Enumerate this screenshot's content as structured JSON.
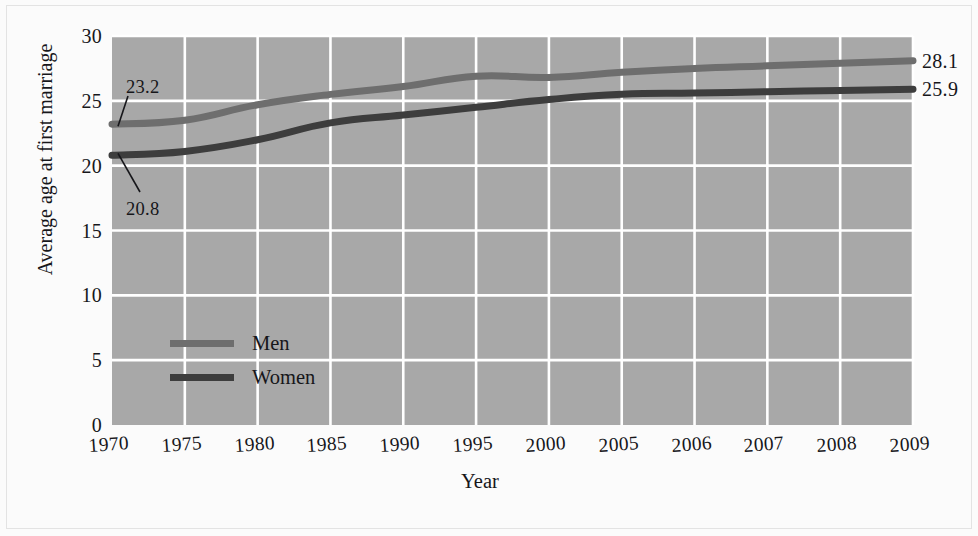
{
  "chart_data": {
    "type": "line",
    "title": "",
    "xlabel": "Year",
    "ylabel": "Average age at first marriage",
    "categories": [
      "1970",
      "1975",
      "1980",
      "1985",
      "1990",
      "1995",
      "2000",
      "2005",
      "2006",
      "2007",
      "2008",
      "2009"
    ],
    "xticklabels": [
      "1970",
      "1975",
      "1980",
      "1985",
      "1990",
      "1995",
      "2000",
      "2005",
      "2006",
      "2007",
      "2008",
      "2009"
    ],
    "yticklabels": [
      "0",
      "5",
      "10",
      "15",
      "20",
      "25",
      "30"
    ],
    "ylim": [
      0,
      30
    ],
    "ytick_values": [
      0,
      5,
      10,
      15,
      20,
      25,
      30
    ],
    "grid": true,
    "grid_color": "#ffffff",
    "plot_background": "#a8a8a8",
    "legend_position": "inside-lower-left",
    "series": [
      {
        "name": "Men",
        "color": "#6e6e6e",
        "values": [
          23.2,
          23.5,
          24.7,
          25.5,
          26.1,
          26.9,
          26.8,
          27.2,
          27.5,
          27.7,
          27.9,
          28.1
        ],
        "start_label": "23.2",
        "end_label": "28.1"
      },
      {
        "name": "Women",
        "color": "#3d3d3d",
        "values": [
          20.8,
          21.1,
          22.0,
          23.3,
          23.9,
          24.5,
          25.1,
          25.5,
          25.6,
          25.7,
          25.8,
          25.9
        ],
        "start_label": "20.8",
        "end_label": "25.9"
      }
    ],
    "annotations": [
      {
        "text": "23.2",
        "series": "Men",
        "at_category": "1970"
      },
      {
        "text": "20.8",
        "series": "Women",
        "at_category": "1970"
      }
    ],
    "end_labels": [
      {
        "text": "28.1",
        "series": "Men"
      },
      {
        "text": "25.9",
        "series": "Women"
      }
    ]
  },
  "legend": {
    "items": [
      {
        "label": "Men",
        "color": "#6e6e6e"
      },
      {
        "label": "Women",
        "color": "#3d3d3d"
      }
    ]
  },
  "axes": {
    "x_title": "Year",
    "y_title": "Average age at first marriage"
  }
}
